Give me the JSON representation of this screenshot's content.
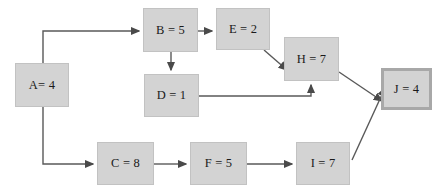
{
  "diagram": {
    "type": "directed-graph",
    "canvas": {
      "width": 448,
      "height": 196,
      "background": "#ffffff"
    },
    "style": {
      "node_fill": "#d3d3d3",
      "node_border": "#c2c2c2",
      "terminal_border": "#a8a8a8",
      "edge_color": "#595959",
      "text_color": "#1a1a1a"
    },
    "nodes": [
      {
        "id": "A",
        "label": "A= 4",
        "activity": "A",
        "value": 4,
        "x": 15,
        "y": 63,
        "w": 54,
        "h": 44,
        "terminal": false
      },
      {
        "id": "B",
        "label": "B = 5",
        "activity": "B",
        "value": 5,
        "x": 143,
        "y": 8,
        "w": 55,
        "h": 44,
        "terminal": false
      },
      {
        "id": "C",
        "label": "C = 8",
        "activity": "C",
        "value": 8,
        "x": 97,
        "y": 142,
        "w": 57,
        "h": 43,
        "terminal": false
      },
      {
        "id": "D",
        "label": "D = 1",
        "activity": "D",
        "value": 1,
        "x": 144,
        "y": 74,
        "w": 55,
        "h": 43,
        "terminal": false
      },
      {
        "id": "E",
        "label": "E = 2",
        "activity": "E",
        "value": 2,
        "x": 216,
        "y": 8,
        "w": 54,
        "h": 42,
        "terminal": false
      },
      {
        "id": "F",
        "label": "F = 5",
        "activity": "F",
        "value": 5,
        "x": 190,
        "y": 142,
        "w": 57,
        "h": 43,
        "terminal": false
      },
      {
        "id": "H",
        "label": "H = 7",
        "activity": "H",
        "value": 7,
        "x": 284,
        "y": 37,
        "w": 55,
        "h": 44,
        "terminal": false
      },
      {
        "id": "I",
        "label": "I = 7",
        "activity": "I",
        "value": 7,
        "x": 296,
        "y": 142,
        "w": 54,
        "h": 43,
        "terminal": false
      },
      {
        "id": "J",
        "label": "J = 4",
        "activity": "J",
        "value": 4,
        "x": 381,
        "y": 68,
        "w": 51,
        "h": 42,
        "terminal": true
      }
    ],
    "edges": [
      {
        "from": "A",
        "to": "B",
        "path": "M 43,63 L 43,31 L 139,31"
      },
      {
        "from": "A",
        "to": "C",
        "path": "M 43,107 L 43,164 L 93,164"
      },
      {
        "from": "B",
        "to": "E",
        "path": "M 198,31 L 212,31"
      },
      {
        "from": "B",
        "to": "D",
        "path": "M 171,52 L 171,70"
      },
      {
        "from": "E",
        "to": "H",
        "path": "M 264,50 L 287,70"
      },
      {
        "from": "D",
        "to": "H",
        "path": "M 199,96 L 311,96 L 311,85"
      },
      {
        "from": "H",
        "to": "J",
        "path": "M 339,72 L 382,101"
      },
      {
        "from": "C",
        "to": "F",
        "path": "M 154,164 L 186,164"
      },
      {
        "from": "F",
        "to": "I",
        "path": "M 247,164 L 292,164"
      },
      {
        "from": "I",
        "to": "J",
        "path": "M 352,160 L 385,88"
      }
    ]
  }
}
